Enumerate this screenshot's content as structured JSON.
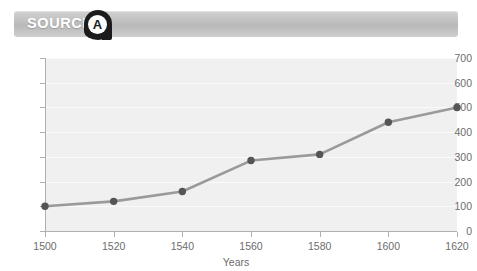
{
  "header": {
    "label": "SOURCE",
    "badge_letter": "A",
    "badge_color": "#1c1c1c",
    "bar_color": "#c2c2c2",
    "label_color": "#ffffff"
  },
  "chart_data": {
    "type": "line",
    "title": "",
    "subtitle": "",
    "xlabel": "Years",
    "ylabel": "",
    "x": [
      1500,
      1520,
      1540,
      1560,
      1580,
      1600,
      1620
    ],
    "values": [
      100,
      120,
      160,
      285,
      310,
      440,
      500
    ],
    "series": [
      {
        "name": "",
        "values": [
          100,
          120,
          160,
          285,
          310,
          440,
          500
        ]
      }
    ],
    "x_tick_labels": [
      "1500",
      "1520",
      "1540",
      "1560",
      "1580",
      "1600",
      "1620"
    ],
    "y_tick_labels": [
      "0",
      "100",
      "200",
      "300",
      "400",
      "500",
      "600",
      "700"
    ],
    "y_ticks": [
      0,
      100,
      200,
      300,
      400,
      500,
      600,
      700
    ],
    "xlim": [
      1500,
      1620
    ],
    "ylim": [
      0,
      700
    ],
    "grid": true,
    "legend": "none",
    "line_color": "#9a9a9a",
    "marker_color": "#555555",
    "plot_background": "#f0f0f0",
    "gridline_color": "#fafafa",
    "axis_color": "#b0b0b0",
    "tick_text_color": "#6d6d6d"
  }
}
